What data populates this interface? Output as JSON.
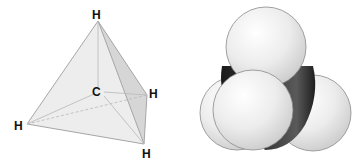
{
  "figure": {
    "panels": [
      {
        "id": "tetrahedral-model",
        "kind": "ball-and-stick tetrahedron",
        "labels": {
          "top": "H",
          "center": "C",
          "right": "H",
          "left": "H",
          "bottom": "H"
        }
      },
      {
        "id": "space-filling-model",
        "kind": "space-filling"
      }
    ]
  },
  "colors": {
    "background": "#ffffff",
    "tetra_face_light": "#ececec",
    "tetra_face_mid": "#dedede",
    "tetra_face_dark": "#cfcfcf",
    "tetra_edge": "#a8a8a8",
    "hydrogen_sphere": "#e8e8e8",
    "hydrogen_outline": "#8a8a8a",
    "carbon": "#262626",
    "label": "#111111"
  }
}
